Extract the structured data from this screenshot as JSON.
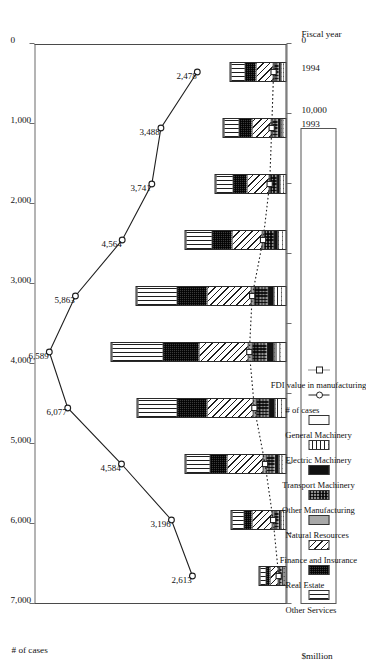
{
  "axes": {
    "top_title": "# of cases",
    "bottom_title": "$million",
    "category_title": "Fiscal year",
    "cases_ticks": [
      "7,000",
      "6,000",
      "5,000",
      "4,000",
      "3,000",
      "2,000",
      "1,000",
      "0"
    ],
    "value_ticks": [
      "80,000",
      "70,000",
      "60,000",
      "50,000",
      "40,000",
      "30,000",
      "20,000",
      "10,000",
      "0"
    ],
    "cases_max": 7000,
    "value_max": 80000
  },
  "legend": {
    "series": [
      {
        "key": "other_services",
        "label": "Other Services",
        "pattern": "vertical-stripes"
      },
      {
        "key": "real_estate",
        "label": "Real Estate",
        "pattern": "dense-dots"
      },
      {
        "key": "finance_insurance",
        "label": "Finance and Insurance",
        "pattern": "diagonal-hatch"
      },
      {
        "key": "natural_resources",
        "label": "Natural Resources",
        "pattern": "solid-gray"
      },
      {
        "key": "other_manufacturing",
        "label": "Other Manufacturing",
        "pattern": "checker-dots"
      },
      {
        "key": "transport_machinery",
        "label": "Transport Machinery",
        "pattern": "solid-black"
      },
      {
        "key": "electric_machinery",
        "label": "Electric Machinery",
        "pattern": "grid"
      },
      {
        "key": "general_machinery",
        "label": "General Machinery",
        "pattern": "blank"
      }
    ],
    "lines": [
      {
        "key": "cases",
        "label": "# of cases",
        "marker": "circle",
        "style": "solid"
      },
      {
        "key": "fdi_manufacturing",
        "label": "FDI value in manufacturing",
        "marker": "square",
        "style": "dotted"
      }
    ]
  },
  "chart_data": {
    "type": "bar",
    "title": "",
    "xlabel": "Fiscal year",
    "ylabel": "$million",
    "ylabel_secondary": "# of cases",
    "ylim": [
      0,
      80000
    ],
    "ylim_secondary": [
      0,
      7000
    ],
    "grid": false,
    "legend_position": "top",
    "categories": [
      "1985",
      "1986",
      "1987",
      "1988",
      "1989",
      "1990",
      "1991",
      "1992",
      "1993",
      "1994"
    ],
    "stack_order_from_base": [
      "general_machinery",
      "electric_machinery",
      "transport_machinery",
      "other_manufacturing",
      "natural_resources",
      "finance_insurance",
      "real_estate",
      "other_services"
    ],
    "series": [
      {
        "name": "General Machinery",
        "key": "general_machinery",
        "values": [
          380,
          620,
          900,
          1350,
          1500,
          1400,
          950,
          700,
          620,
          560
        ]
      },
      {
        "name": "Electric Machinery",
        "key": "electric_machinery",
        "values": [
          520,
          900,
          1400,
          2100,
          2450,
          2300,
          1550,
          1150,
          1000,
          880
        ]
      },
      {
        "name": "Transport Machinery",
        "key": "transport_machinery",
        "values": [
          430,
          720,
          1250,
          1800,
          2050,
          1900,
          1300,
          900,
          800,
          700
        ]
      },
      {
        "name": "Other Manufacturing",
        "key": "other_manufacturing",
        "values": [
          950,
          1700,
          2900,
          4300,
          4900,
          4500,
          3100,
          2200,
          1950,
          1700
        ]
      },
      {
        "name": "Natural Resources",
        "key": "natural_resources",
        "values": [
          260,
          430,
          700,
          1000,
          1150,
          1050,
          720,
          520,
          460,
          400
        ]
      },
      {
        "name": "Finance and Insurance",
        "key": "finance_insurance",
        "values": [
          2600,
          6300,
          11500,
          14500,
          15600,
          13800,
          9400,
          6900,
          6100,
          5300
        ]
      },
      {
        "name": "Real Estate",
        "key": "real_estate",
        "values": [
          1200,
          2600,
          5600,
          9600,
          11500,
          9700,
          6400,
          4400,
          3900,
          3400
        ]
      },
      {
        "name": "Other Services",
        "key": "other_services",
        "values": [
          1900,
          4000,
          7500,
          12400,
          16000,
          12600,
          8300,
          5600,
          5000,
          4400
        ]
      }
    ],
    "line_series": [
      {
        "name": "# of cases",
        "key": "cases",
        "axis": "secondary",
        "marker": "circle",
        "style": "solid",
        "labels_shown": true,
        "values": [
          2613,
          3196,
          4584,
          6077,
          6589,
          5863,
          4564,
          3741,
          3488,
          2478
        ],
        "value_labels": [
          "2,613",
          "3,196",
          "4,584",
          "6,077",
          "6,589",
          "5,863",
          "4,564",
          "3,741",
          "3,488",
          "2,478"
        ]
      },
      {
        "name": "FDI value in manufacturing",
        "key": "fdi_manufacturing",
        "axis": "primary",
        "marker": "square",
        "style": "dotted",
        "labels_shown": false,
        "values": [
          2480,
          4250,
          6800,
          10200,
          11800,
          10900,
          7450,
          5350,
          4700,
          4100
        ]
      }
    ],
    "bar_totals": [
      8240,
      17270,
      31750,
      47050,
      55150,
      47250,
      31720,
      22370,
      19830,
      17340
    ]
  }
}
